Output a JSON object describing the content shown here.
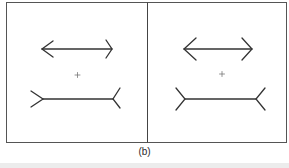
{
  "figure": {
    "caption": "(b)",
    "panels": [
      {
        "id": "left",
        "top_figure": "double-headed arrow with outward-pointing arrowheads",
        "center_marker": "+",
        "bottom_figure": "line with inward-pointing fins (tails)"
      },
      {
        "id": "right",
        "top_figure": "double-headed arrow with outward-pointing arrowheads (larger heads)",
        "center_marker": "+",
        "bottom_figure": "line with inward-pointing fins (tails, larger)"
      }
    ],
    "colors": {
      "stroke": "#333333",
      "frame": "#555555",
      "background": "#ffffff"
    }
  }
}
